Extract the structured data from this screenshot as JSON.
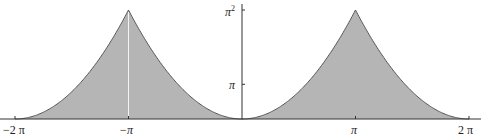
{
  "chart_data": {
    "type": "area",
    "title": "",
    "xlabel": "",
    "ylabel": "",
    "function": "periodic extension of x^2 on [-pi, pi] with period 2*pi",
    "xlim": [
      -6.2832,
      6.2832
    ],
    "ylim": [
      0,
      9.8696
    ],
    "x_ticks": [
      {
        "value": -6.2832,
        "label": "−2 π"
      },
      {
        "value": -3.1416,
        "label": "−π"
      },
      {
        "value": 3.1416,
        "label": "π"
      },
      {
        "value": 6.2832,
        "label": "2 π"
      }
    ],
    "y_ticks": [
      {
        "value": 3.1416,
        "label": "π"
      },
      {
        "value": 9.8696,
        "label": "π²"
      }
    ],
    "series": [
      {
        "name": "f(x)",
        "x": [
          -6.2832,
          -5.4978,
          -4.7124,
          -3.927,
          -3.1416,
          -2.3562,
          -1.5708,
          -0.7854,
          0,
          0.7854,
          1.5708,
          2.3562,
          3.1416,
          3.927,
          4.7124,
          5.4978,
          6.2832
        ],
        "values": [
          0,
          0.617,
          2.467,
          5.551,
          9.87,
          5.551,
          2.467,
          0.617,
          0,
          0.617,
          2.467,
          5.551,
          9.87,
          5.551,
          2.467,
          0.617,
          0
        ]
      }
    ],
    "fill_color": "#b5b5b5",
    "line_color": "#555555",
    "grid": false,
    "legend": null
  },
  "labels": {
    "x_neg_2pi": "−2 π",
    "x_neg_pi": "−π",
    "x_pi": "π",
    "x_2pi": "2 π",
    "y_pi": "π",
    "y_pi_sq_base": "π",
    "y_pi_sq_exp": "2"
  }
}
